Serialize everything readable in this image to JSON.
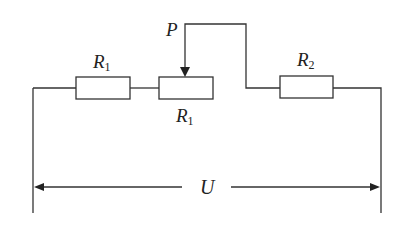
{
  "diagram": {
    "type": "circuit",
    "line_color": "#333333",
    "labels": {
      "slider": "P",
      "r1_fixed": {
        "main": "R",
        "sub": "1"
      },
      "r1_rheostat": {
        "main": "R",
        "sub": "1"
      },
      "r2": {
        "main": "R",
        "sub": "2"
      },
      "voltage": "U"
    },
    "components": [
      {
        "id": "resistor-r1-fixed",
        "label": "R1"
      },
      {
        "id": "rheostat-r1",
        "label": "R1",
        "slider": "P"
      },
      {
        "id": "resistor-r2",
        "label": "R2"
      }
    ]
  }
}
